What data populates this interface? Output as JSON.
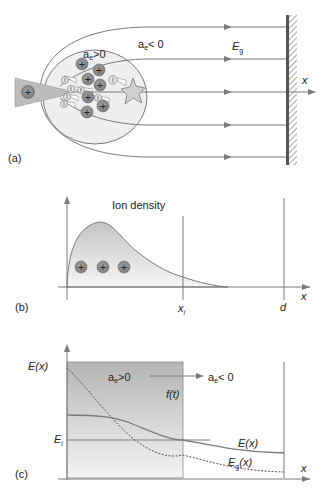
{
  "figure": {
    "top_fragment": "ig . . . . . . . . . . . . . ( )",
    "panel_a": {
      "label": "(a)",
      "inner_region_label": "a",
      "inner_region_sub": "e",
      "inner_region_rel": ">0",
      "outer_region_label": "a",
      "outer_region_sub": "e",
      "outer_region_rel": "< 0",
      "field_label": "E",
      "field_sub": "g",
      "axis_label": "x",
      "ion_symbol": "+",
      "electron_symbol": "−",
      "icons": [
        "cone-tip-icon",
        "ion-icon",
        "electron-icon",
        "star-burst-icon",
        "wall-electrode-icon",
        "arrow-icon"
      ]
    },
    "panel_b": {
      "label": "(b)",
      "title": "Ion density",
      "x_axis_label": "x",
      "marker_xi_label": "x",
      "marker_xi_sub": "i",
      "marker_d_label": "d",
      "ion_symbol": "+"
    },
    "panel_c": {
      "label": "(c)",
      "y_axis_label": "E(x)",
      "x_axis_label": "x",
      "left_region_label": "a",
      "left_region_sub": "e",
      "left_region_rel": ">0",
      "right_region_label": "a",
      "right_region_sub": "e",
      "right_region_rel": "< 0",
      "front_label": "f(t)",
      "ei_label": "E",
      "ei_sub": "i",
      "curve_E_label": "E(x)",
      "curve_Eg_label": "E",
      "curve_Eg_sub": "g",
      "curve_Eg_suffix": "(x)"
    },
    "colors": {
      "line": "#6e6e6e",
      "ion_fill": "#8f8f8f",
      "electron_fill": "#e4e4e4",
      "shade_dark": "#b9b9b9",
      "shade_light": "#f2f2f2",
      "wall": "#555555"
    }
  }
}
